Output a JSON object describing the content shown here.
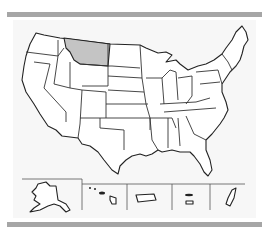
{
  "map": {
    "type": "us-states-outline",
    "highlighted_states": [
      "Montana"
    ],
    "colors": {
      "highlight_fill": "#c4c4c4",
      "state_fill": "#ffffff",
      "border": "#222222",
      "frame_bar": "#a6a6a6",
      "background": "#f7f7f7"
    },
    "insets": [
      "Alaska",
      "Hawaii",
      "Puerto Rico",
      "U.S. Virgin Islands",
      "Guam"
    ]
  }
}
